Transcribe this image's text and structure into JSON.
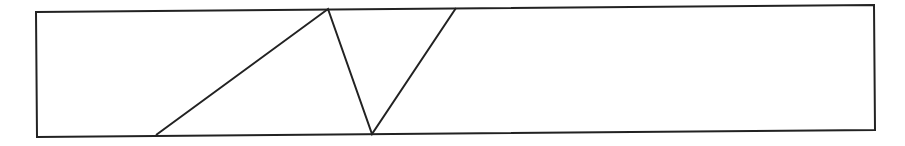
{
  "diagram": {
    "width": 905,
    "height": 146,
    "stroke_color": "#222222",
    "stroke_width": 2,
    "background": "#ffffff",
    "frame": {
      "points": [
        [
          36,
          12
        ],
        [
          874,
          5
        ],
        [
          875,
          130
        ],
        [
          37,
          137
        ]
      ]
    },
    "zigzag": {
      "points": [
        [
          156,
          135
        ],
        [
          328,
          9
        ],
        [
          372,
          134
        ],
        [
          456,
          8
        ]
      ]
    }
  }
}
